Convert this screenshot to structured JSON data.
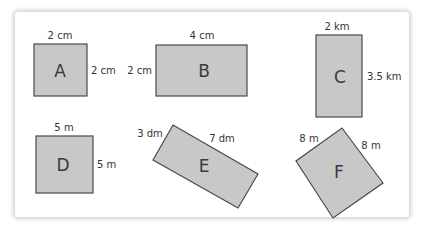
{
  "figure": {
    "colors": {
      "shape_fill": "#c8c8c8",
      "shape_stroke": "#4a4a4a",
      "text": "#333333",
      "background": "#ffffff"
    },
    "shapes": [
      {
        "label": "A",
        "type": "square",
        "top": "2 cm",
        "side": "2 cm"
      },
      {
        "label": "B",
        "type": "rectangle",
        "top": "4 cm",
        "side": "2 cm"
      },
      {
        "label": "C",
        "type": "rectangle",
        "top": "2 km",
        "side": "3.5 km"
      },
      {
        "label": "D",
        "type": "square",
        "top": "5 m",
        "side": "5 m"
      },
      {
        "label": "E",
        "type": "rectangle-rotated",
        "short": "3 dm",
        "long": "7 dm"
      },
      {
        "label": "F",
        "type": "square-rotated",
        "left": "8 m",
        "right": "8 m"
      }
    ]
  }
}
